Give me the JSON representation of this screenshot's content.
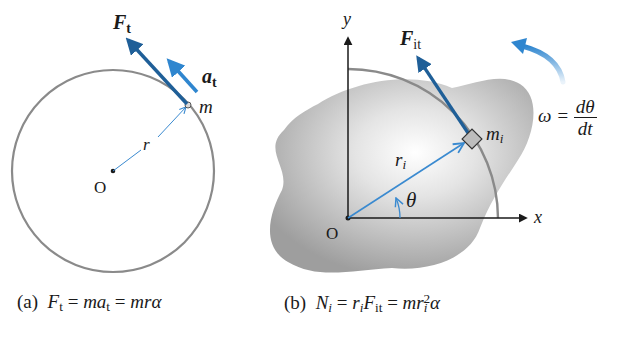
{
  "figure_a": {
    "force_label": "F",
    "force_sub": "t",
    "accel_label": "a",
    "accel_sub": "t",
    "mass_label": "m",
    "radius_label": "r",
    "origin_label": "O",
    "caption": {
      "tag": "(a)",
      "lhs": "F",
      "lhs_sub": "t",
      "eq1": "=",
      "mid": "ma",
      "mid_sub": "t",
      "eq2": "=",
      "rhs": "mrα"
    }
  },
  "figure_b": {
    "y_axis_label": "y",
    "x_axis_label": "x",
    "force_label": "F",
    "force_sub": "it",
    "mass_label": "m",
    "mass_sub": "i",
    "radius_label": "r",
    "radius_sub": "i",
    "angle_label": "θ",
    "origin_label": "O",
    "omega_lhs": "ω =",
    "omega_num": "dθ",
    "omega_den": "dt",
    "caption": {
      "tag": "(b)",
      "lhs": "N",
      "lhs_sub": "i",
      "eq1": "=",
      "r": "r",
      "r_sub": "i",
      "f": "F",
      "f_sub": "it",
      "eq2": "=",
      "mr": "mr",
      "mr_sub": "i",
      "mr_sup": "2",
      "alpha": "α"
    }
  },
  "colors": {
    "arrow_dark_blue": "#1f5f98",
    "arrow_light_blue": "#2f86cf",
    "circle_gray": "#8a8a8a",
    "blob_gray": "#a9a9a9",
    "axis_black": "#1a1a1a"
  }
}
